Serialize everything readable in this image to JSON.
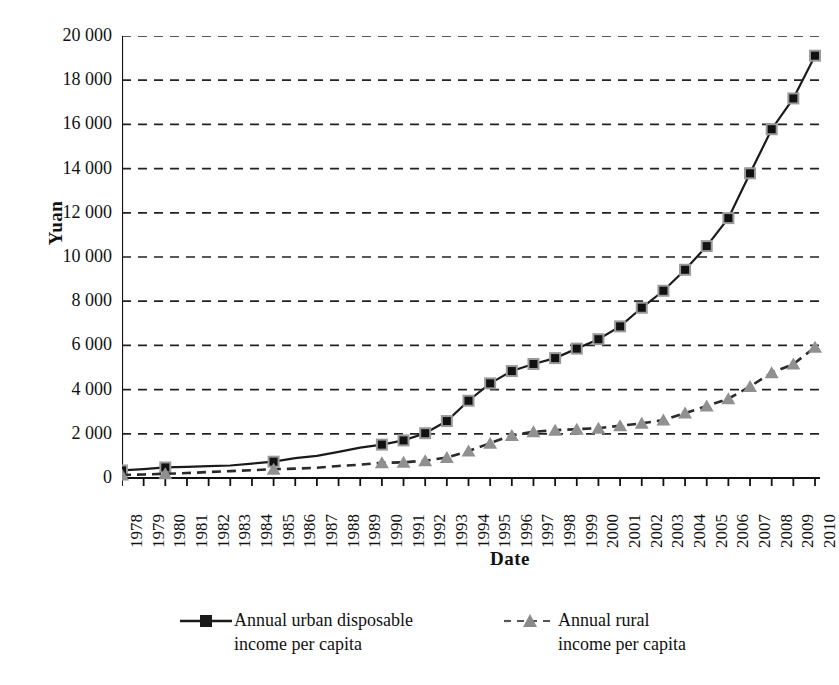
{
  "chart_data": {
    "type": "line",
    "title": "",
    "xlabel": "Date",
    "ylabel": "Yuan",
    "ylim": [
      0,
      20000
    ],
    "ytick_labels": [
      "20 000",
      "18 000",
      "16 000",
      "14 000",
      "12 000",
      "10 000",
      "8 000",
      "6 000",
      "4 000",
      "2 000",
      "0"
    ],
    "ytick_values": [
      20000,
      18000,
      16000,
      14000,
      12000,
      10000,
      8000,
      6000,
      4000,
      2000,
      0
    ],
    "grid": "horizontal-dashed",
    "legend_position": "bottom",
    "x": [
      1978,
      1979,
      1980,
      1981,
      1982,
      1983,
      1984,
      1985,
      1986,
      1987,
      1988,
      1989,
      1990,
      1991,
      1992,
      1993,
      1994,
      1995,
      1996,
      1997,
      1998,
      1999,
      2000,
      2001,
      2002,
      2003,
      2004,
      2005,
      2006,
      2007,
      2008,
      2009,
      2010
    ],
    "xtick_labels": [
      "1978",
      "1979",
      "1980",
      "1981",
      "1982",
      "1983",
      "1984",
      "1985",
      "1986",
      "1987",
      "1988",
      "1989",
      "1990",
      "1991",
      "1992",
      "1993",
      "1994",
      "1995",
      "1996",
      "1997",
      "1998",
      "1999",
      "2000",
      "2001",
      "2002",
      "2003",
      "2004",
      "2005",
      "2006",
      "2007",
      "2008",
      "2009",
      "2010"
    ],
    "series": [
      {
        "name": "Annual urban disposable income per capita",
        "label_line1": "Annual urban disposable",
        "label_line2": "income per capita",
        "color": "#1a1a1a",
        "line_style": "solid",
        "marker": "square",
        "marker_color": "#1a1a1a",
        "marker_years": [
          1978,
          1980,
          1985,
          1990,
          1991,
          1992,
          1993,
          1994,
          1995,
          1996,
          1997,
          1998,
          1999,
          2000,
          2001,
          2002,
          2003,
          2004,
          2005,
          2006,
          2007,
          2008,
          2009,
          2010
        ],
        "values": [
          343,
          405,
          478,
          500,
          535,
          565,
          652,
          739,
          900,
          1002,
          1181,
          1376,
          1510,
          1701,
          2027,
          2577,
          3496,
          4283,
          4839,
          5160,
          5425,
          5854,
          6280,
          6860,
          7703,
          8472,
          9422,
          10493,
          11760,
          13786,
          15781,
          17175,
          19109
        ]
      },
      {
        "name": "Annual rural income per capita",
        "label_line1": "Annual rural",
        "label_line2": "income per capita",
        "color": "#8a8a8a",
        "line_style": "dashed",
        "marker": "triangle",
        "marker_color": "#909090",
        "marker_years": [
          1978,
          1980,
          1985,
          1990,
          1991,
          1992,
          1993,
          1994,
          1995,
          1996,
          1997,
          1998,
          1999,
          2000,
          2001,
          2002,
          2003,
          2004,
          2005,
          2006,
          2007,
          2008,
          2009,
          2010
        ],
        "values": [
          134,
          160,
          191,
          223,
          270,
          310,
          355,
          398,
          424,
          463,
          545,
          602,
          686,
          709,
          784,
          922,
          1221,
          1578,
          1926,
          2090,
          2162,
          2210,
          2253,
          2366,
          2476,
          2622,
          2936,
          3255,
          3587,
          4140,
          4761,
          5153,
          5919
        ]
      }
    ]
  },
  "axes": {
    "y_title": "Yuan",
    "x_title": "Date"
  },
  "legend": {
    "urban": {
      "line1": "Annual urban disposable",
      "line2": "income per capita"
    },
    "rural": {
      "line1": "Annual rural",
      "line2": "income per capita"
    }
  }
}
